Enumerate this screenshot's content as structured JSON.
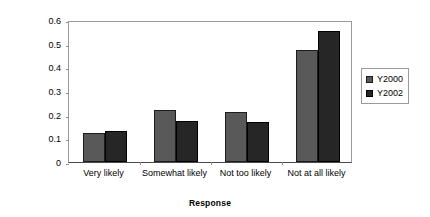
{
  "chart_data": {
    "type": "bar",
    "title": "",
    "xlabel": "Response",
    "ylabel": "Relative Frequency",
    "categories": [
      "Very likely",
      "Somewhat likely",
      "Not too likely",
      "Not at all likely"
    ],
    "series": [
      {
        "name": "Y2000",
        "color": "#595959",
        "values": [
          0.122,
          0.22,
          0.21,
          0.475
        ]
      },
      {
        "name": "Y2002",
        "color": "#262626",
        "values": [
          0.131,
          0.175,
          0.17,
          0.555
        ]
      }
    ],
    "ylim": [
      0,
      0.6
    ],
    "yticks": [
      0,
      0.1,
      0.2,
      0.3,
      0.4,
      0.5,
      0.6
    ],
    "ytick_labels": [
      "0",
      "0.1",
      "0.2",
      "0.3",
      "0.4",
      "0.5",
      "0.6"
    ],
    "grid": false,
    "legend_position": "right",
    "legend_entries": [
      "Y2000",
      "Y2002"
    ]
  },
  "axis": {
    "y_title": "Relative Frequency",
    "x_title": "Response"
  },
  "legend": {
    "items": [
      {
        "label": "Y2000"
      },
      {
        "label": "Y2002"
      }
    ]
  }
}
